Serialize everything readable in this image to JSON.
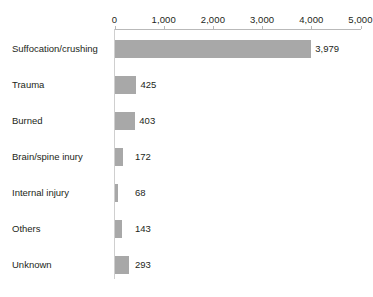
{
  "chart_data": {
    "type": "bar",
    "orientation": "horizontal",
    "title": "",
    "xlabel": "",
    "ylabel": "",
    "xlim": [
      0,
      5000
    ],
    "grid": false,
    "legend": null,
    "bar_color": "#a8a8a8",
    "text_color": "#231f20",
    "axis_color": "#b9b9b9",
    "tick_labels": [
      "0",
      "1,000",
      "2,000",
      "3,000",
      "4,000",
      "5,000"
    ],
    "ticks": [
      0,
      1000,
      2000,
      3000,
      4000,
      5000
    ],
    "categories": [
      "Suffocation/crushing",
      "Trauma",
      "Burned",
      "Brain/spine inury",
      "Internal injury",
      "Others",
      "Unknown"
    ],
    "values": [
      3979,
      425,
      403,
      172,
      68,
      143,
      293
    ],
    "value_labels": [
      "3,979",
      "425",
      "403",
      "172",
      "68",
      "143",
      "293"
    ]
  },
  "footnote": {
    "text": ""
  }
}
